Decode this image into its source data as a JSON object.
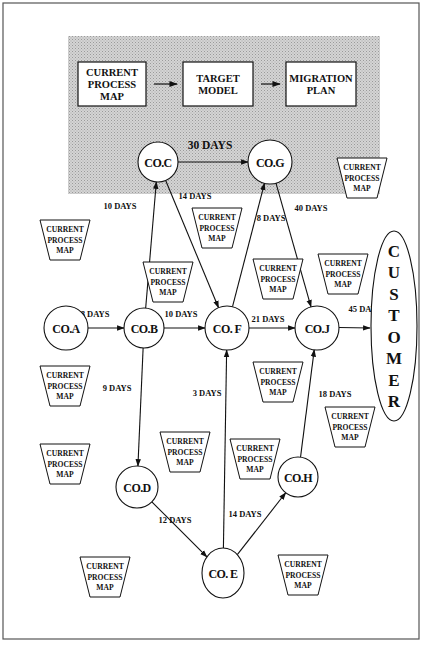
{
  "header": {
    "boxes": [
      {
        "id": "current-process-map",
        "lines": [
          "CURRENT",
          "PROCESS",
          "MAP"
        ],
        "x": 78,
        "y": 62,
        "w": 68,
        "h": 44
      },
      {
        "id": "target-model",
        "lines": [
          "TARGET",
          "MODEL"
        ],
        "x": 183,
        "y": 62,
        "w": 70,
        "h": 44
      },
      {
        "id": "migration-plan",
        "lines": [
          "MIGRATION",
          "PLAN"
        ],
        "x": 286,
        "y": 62,
        "w": 70,
        "h": 44
      }
    ]
  },
  "nodes": [
    {
      "id": "co-a",
      "label": "CO.A",
      "cx": 66,
      "cy": 328,
      "r": 22
    },
    {
      "id": "co-b",
      "label": "CO.B",
      "cx": 144,
      "cy": 328,
      "r": 20
    },
    {
      "id": "co-c",
      "label": "CO.C",
      "cx": 158,
      "cy": 162,
      "r": 20
    },
    {
      "id": "co-d",
      "label": "CO.D",
      "cx": 137,
      "cy": 487,
      "r": 21
    },
    {
      "id": "co-e",
      "label": "CO. E",
      "cx": 223,
      "cy": 573,
      "r": 21,
      "ry": 25
    },
    {
      "id": "co-f",
      "label": "CO. F",
      "cx": 227,
      "cy": 328,
      "r": 22
    },
    {
      "id": "co-g",
      "label": "CO.G",
      "cx": 270,
      "cy": 162,
      "r": 22
    },
    {
      "id": "co-h",
      "label": "CO.H",
      "cx": 298,
      "cy": 477,
      "r": 20
    },
    {
      "id": "co-j",
      "label": "CO.J",
      "cx": 317,
      "cy": 328,
      "r": 22
    }
  ],
  "edges": [
    {
      "from": "co-a",
      "to": "co-b",
      "label": "8 DAYS",
      "lx": 95,
      "ly": 317
    },
    {
      "from": "co-b",
      "to": "co-f",
      "label": "10 DAYS",
      "lx": 181,
      "ly": 317
    },
    {
      "from": "co-f",
      "to": "co-j",
      "label": "21 DAYS",
      "lx": 268,
      "ly": 322
    },
    {
      "from": "co-j",
      "to": "customer",
      "label": "45 DAYS",
      "lx": 365,
      "ly": 312
    },
    {
      "from": "co-c",
      "to": "co-g",
      "label": "30 DAYS",
      "lx": 210,
      "ly": 149
    },
    {
      "from": "co-b",
      "to": "co-c",
      "label": "10 DAYS",
      "lx": 120,
      "ly": 209
    },
    {
      "from": "co-c",
      "to": "co-f",
      "label": "14 DAYS",
      "lx": 195,
      "ly": 199
    },
    {
      "from": "co-f",
      "to": "co-g",
      "label": "8 DAYS",
      "lx": 271,
      "ly": 221
    },
    {
      "from": "co-g",
      "to": "co-j",
      "label": "40 DAYS",
      "lx": 311,
      "ly": 211
    },
    {
      "from": "co-b",
      "to": "co-d",
      "label": "9 DAYS",
      "lx": 117,
      "ly": 391
    },
    {
      "from": "co-d",
      "to": "co-e",
      "label": "12 DAYS",
      "lx": 175,
      "ly": 523
    },
    {
      "from": "co-e",
      "to": "co-f",
      "label": "3 DAYS",
      "lx": 207,
      "ly": 396
    },
    {
      "from": "co-e",
      "to": "co-h",
      "label": "14 DAYS",
      "lx": 245,
      "ly": 517
    },
    {
      "from": "co-h",
      "to": "co-j",
      "label": "18 DAYS",
      "lx": 335,
      "ly": 397
    }
  ],
  "customer": {
    "letters": [
      "C",
      "U",
      "S",
      "T",
      "O",
      "M",
      "E",
      "R"
    ],
    "cx": 394,
    "cy": 326,
    "rx": 23,
    "ry": 95
  },
  "process_maps": {
    "lines": [
      "CURRENT",
      "PROCESS",
      "MAP"
    ],
    "items": [
      {
        "x": 362,
        "y": 158
      },
      {
        "x": 65,
        "y": 220
      },
      {
        "x": 217,
        "y": 208
      },
      {
        "x": 168,
        "y": 262
      },
      {
        "x": 278,
        "y": 259
      },
      {
        "x": 343,
        "y": 254
      },
      {
        "x": 65,
        "y": 366
      },
      {
        "x": 278,
        "y": 362
      },
      {
        "x": 65,
        "y": 444
      },
      {
        "x": 185,
        "y": 432
      },
      {
        "x": 255,
        "y": 439
      },
      {
        "x": 350,
        "y": 407
      },
      {
        "x": 105,
        "y": 557
      },
      {
        "x": 303,
        "y": 555
      }
    ]
  }
}
